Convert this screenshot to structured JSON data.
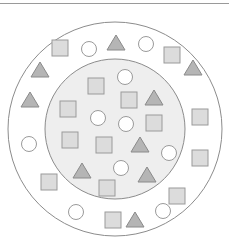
{
  "diagram": {
    "type": "concentric-set-diagram",
    "colors": {
      "background": "#ffffff",
      "ring_stroke": "#8c8c8c",
      "inner_fill": "#eeeeee",
      "square_fill": "#dcdcdc",
      "square_stroke": "#9a9a9a",
      "triangle_fill": "#b5b5b5",
      "triangle_stroke": "#8a8a8a",
      "circle_fill": "#ffffff",
      "circle_stroke": "#9a9a9a"
    },
    "outer_circle": {
      "cx": 115,
      "cy": 129,
      "r": 107
    },
    "inner_circle": {
      "cx": 115,
      "cy": 129,
      "r": 70
    },
    "shape_size": 16,
    "outer_ring_shapes": [
      {
        "type": "square",
        "x": 60,
        "y": 48
      },
      {
        "type": "circle",
        "x": 89,
        "y": 49
      },
      {
        "type": "triangle",
        "x": 116,
        "y": 43
      },
      {
        "type": "circle",
        "x": 146,
        "y": 44
      },
      {
        "type": "square",
        "x": 172,
        "y": 55
      },
      {
        "type": "triangle",
        "x": 40,
        "y": 70
      },
      {
        "type": "triangle",
        "x": 193,
        "y": 68
      },
      {
        "type": "triangle",
        "x": 30,
        "y": 100
      },
      {
        "type": "square",
        "x": 200,
        "y": 117
      },
      {
        "type": "circle",
        "x": 29,
        "y": 144
      },
      {
        "type": "square",
        "x": 200,
        "y": 158
      },
      {
        "type": "square",
        "x": 49,
        "y": 182
      },
      {
        "type": "square",
        "x": 177,
        "y": 196
      },
      {
        "type": "circle",
        "x": 76,
        "y": 212
      },
      {
        "type": "circle",
        "x": 163,
        "y": 211
      },
      {
        "type": "square",
        "x": 113,
        "y": 220
      },
      {
        "type": "triangle",
        "x": 135,
        "y": 220
      }
    ],
    "inner_shapes": [
      {
        "type": "square",
        "x": 96,
        "y": 86
      },
      {
        "type": "circle",
        "x": 125,
        "y": 77
      },
      {
        "type": "square",
        "x": 68,
        "y": 109
      },
      {
        "type": "square",
        "x": 129,
        "y": 100
      },
      {
        "type": "triangle",
        "x": 154,
        "y": 98
      },
      {
        "type": "circle",
        "x": 98,
        "y": 118
      },
      {
        "type": "circle",
        "x": 126,
        "y": 124
      },
      {
        "type": "square",
        "x": 154,
        "y": 123
      },
      {
        "type": "square",
        "x": 70,
        "y": 140
      },
      {
        "type": "square",
        "x": 104,
        "y": 145
      },
      {
        "type": "triangle",
        "x": 140,
        "y": 145
      },
      {
        "type": "circle",
        "x": 169,
        "y": 153
      },
      {
        "type": "triangle",
        "x": 82,
        "y": 171
      },
      {
        "type": "circle",
        "x": 121,
        "y": 168
      },
      {
        "type": "triangle",
        "x": 147,
        "y": 175
      },
      {
        "type": "square",
        "x": 107,
        "y": 188
      }
    ],
    "counts": {
      "outer_ring": {
        "squares": 7,
        "circles": 5,
        "triangles": 5
      },
      "inner": {
        "squares": 7,
        "circles": 5,
        "triangles": 4
      }
    }
  }
}
